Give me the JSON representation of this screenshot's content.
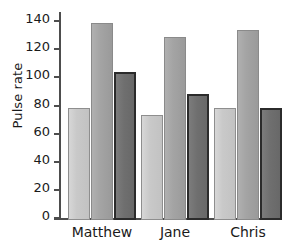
{
  "chart_data": {
    "type": "bar",
    "title": "",
    "xlabel": "",
    "ylabel": "Pulse rate",
    "categories": [
      "Matthew",
      "Jane",
      "Chris"
    ],
    "series": [
      {
        "name": "series-1",
        "color": "#c9c9c9",
        "values": [
          80,
          75,
          80
        ]
      },
      {
        "name": "series-2",
        "color": "#a4a4a4",
        "values": [
          140,
          130,
          135
        ]
      },
      {
        "name": "series-3",
        "color": "#6f6f6f",
        "values": [
          105,
          90,
          80
        ]
      }
    ],
    "ylim": [
      0,
      148
    ],
    "yticks": [
      0,
      20,
      40,
      60,
      80,
      100,
      120,
      140
    ],
    "ytick_labels": [
      "0",
      "20",
      "40",
      "60",
      "80",
      "100",
      "120",
      "140"
    ],
    "grid": false,
    "legend": "none"
  },
  "axis": {
    "y_title": "Pulse rate"
  }
}
